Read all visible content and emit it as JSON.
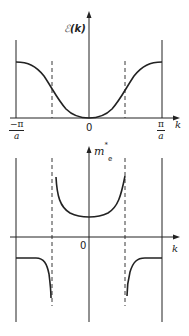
{
  "top_plot": {
    "y_label": "ℰ(k)",
    "y_label_symbol": "ℰ",
    "y_label_arg": "(k)",
    "x_label": "k",
    "origin_label": "0",
    "left_limit": {
      "numerator": "−π",
      "denominator": "a"
    },
    "right_limit": {
      "numerator": "π",
      "denominator": "a"
    }
  },
  "bottom_plot": {
    "y_label": "m*e",
    "y_label_base": "m",
    "y_label_sup": "*",
    "y_label_sub": "e",
    "x_label": "k",
    "origin_label": "0"
  },
  "colors": {
    "line": "#222222",
    "background": "#ffffff"
  }
}
